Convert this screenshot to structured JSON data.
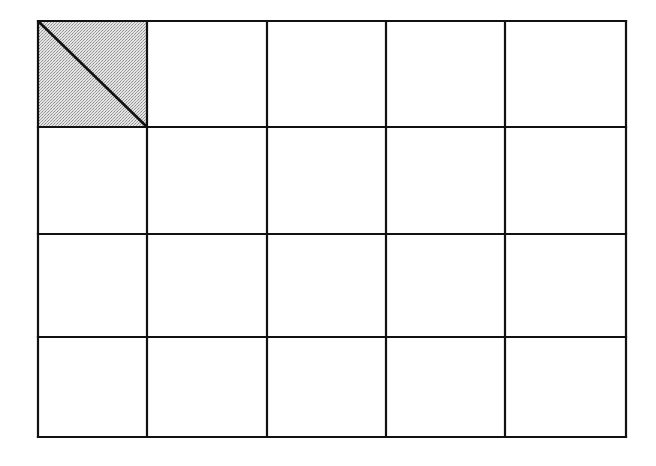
{
  "diagram": {
    "type": "grid",
    "rows": 4,
    "columns": 5,
    "frame": {
      "x": 38,
      "y": 21,
      "width": 588,
      "height": 416
    },
    "column_edges": [
      38,
      147,
      267,
      386,
      505,
      626
    ],
    "row_edges": [
      21,
      127,
      234,
      337,
      437
    ],
    "line_color": "#111111",
    "line_width": 2.2,
    "background_color": "#ffffff",
    "highlighted_cells": [
      {
        "row": 0,
        "column": 0,
        "fill_color": "#cfcfcf",
        "fill_pattern": "stipple",
        "diagonal": {
          "from": "top-left",
          "to": "bottom-right"
        }
      }
    ]
  }
}
